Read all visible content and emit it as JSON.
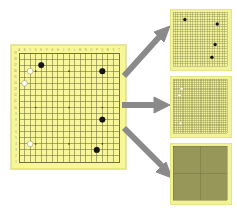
{
  "figure": {
    "background_color": "#ffffff",
    "board_color": "#f7f79a",
    "grid_color": "#6b6b3a",
    "star_point_color": "#4a4a20",
    "black_stone_color": "#141414",
    "white_stone_color": "#fdfdf2",
    "arrow_color": "#8a8a8a"
  },
  "main_board": {
    "name": "go-board",
    "size": 19,
    "label": "",
    "column_labels": [
      "A",
      "B",
      "C",
      "D",
      "E",
      "F",
      "G",
      "H",
      "J",
      "K",
      "L",
      "M",
      "N",
      "O",
      "P",
      "Q",
      "R",
      "S",
      "T"
    ],
    "row_labels": [
      "19",
      "18",
      "17",
      "16",
      "15",
      "14",
      "13",
      "12",
      "11",
      "10",
      "9",
      "8",
      "7",
      "6",
      "5",
      "4",
      "3",
      "2",
      "1"
    ],
    "star_points": [
      {
        "col": 3,
        "row": 3
      },
      {
        "col": 9,
        "row": 3
      },
      {
        "col": 15,
        "row": 3
      },
      {
        "col": 3,
        "row": 9
      },
      {
        "col": 9,
        "row": 9
      },
      {
        "col": 15,
        "row": 9
      },
      {
        "col": 3,
        "row": 15
      },
      {
        "col": 9,
        "row": 15
      },
      {
        "col": 15,
        "row": 15
      }
    ],
    "stones": [
      {
        "color": "black",
        "col": 4,
        "row": 2
      },
      {
        "color": "black",
        "col": 15,
        "row": 3
      },
      {
        "color": "black",
        "col": 15,
        "row": 11
      },
      {
        "color": "black",
        "col": 14,
        "row": 16
      },
      {
        "color": "white",
        "col": 2,
        "row": 3
      },
      {
        "color": "white",
        "col": 1,
        "row": 5
      },
      {
        "color": "white",
        "col": 2,
        "row": 15
      }
    ]
  },
  "panels": [
    {
      "name": "panel-coarse",
      "label": "",
      "grid_divisions": 22,
      "stones": [
        {
          "color": "black",
          "x": 0.22,
          "y": 0.14
        },
        {
          "color": "black",
          "x": 0.82,
          "y": 0.22
        },
        {
          "color": "black",
          "x": 0.78,
          "y": 0.6
        },
        {
          "color": "black",
          "x": 0.72,
          "y": 0.84
        }
      ]
    },
    {
      "name": "panel-mid",
      "label": "",
      "grid_divisions": 30,
      "stones": [
        {
          "color": "white",
          "x": 0.16,
          "y": 0.18
        },
        {
          "color": "white",
          "x": 0.12,
          "y": 0.3
        },
        {
          "color": "white",
          "x": 0.14,
          "y": 0.82
        }
      ]
    },
    {
      "name": "panel-fine",
      "label": "",
      "grid_divisions": 56,
      "stones": []
    }
  ],
  "arrows": [
    {
      "name": "arrow-up-right",
      "direction": "up-right",
      "label": ""
    },
    {
      "name": "arrow-right",
      "direction": "right",
      "label": ""
    },
    {
      "name": "arrow-down-right",
      "direction": "down-right",
      "label": ""
    }
  ]
}
